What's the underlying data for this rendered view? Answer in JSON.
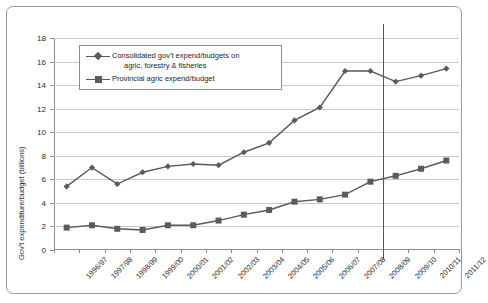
{
  "chart_data": {
    "type": "line",
    "title": "",
    "xlabel": "",
    "ylabel": "Gov't expenditure/budget (billions)",
    "ylim": [
      0,
      18
    ],
    "ytick_step": 2,
    "yticks": [
      "0",
      "2",
      "4",
      "6",
      "8",
      "10",
      "12",
      "14",
      "16",
      "18"
    ],
    "grid": true,
    "legend_position": "upper-left-inside",
    "categories": [
      "1996/97",
      "1997/98",
      "1998/99",
      "1999/00",
      "2000/01",
      "2001/02",
      "2002/03",
      "2003/04",
      "2004/05",
      "2005/06",
      "2006/07",
      "2007/08",
      "2008/09",
      "2009/10",
      "2010/11",
      "2011/12"
    ],
    "series": [
      {
        "name": "Consolidated gov't expend/budgets on agric, forestry & fisheries",
        "marker": "diamond",
        "values": [
          5.4,
          7.0,
          5.6,
          6.6,
          7.1,
          7.3,
          7.2,
          8.3,
          9.1,
          11.0,
          12.1,
          15.2,
          15.2,
          14.3,
          14.8,
          15.4
        ]
      },
      {
        "name": "Provincial agric expend/budget",
        "marker": "square",
        "values": [
          1.9,
          2.1,
          1.8,
          1.7,
          2.1,
          2.1,
          2.5,
          3.0,
          3.4,
          4.1,
          4.3,
          4.7,
          5.8,
          6.3,
          6.9,
          7.6
        ]
      }
    ],
    "annotations": [
      {
        "type": "vertical-line",
        "name": "budget-estimate-divider",
        "at_category_boundary_after": "2008/09"
      }
    ],
    "colors": {
      "series_line": "#59595b",
      "marker": "#5b5b5d",
      "gridline": "#c9c9c9",
      "axis": "#8d8d8d",
      "border": "#9a9a9a",
      "background": "#ffffff",
      "divider_line": "#555555",
      "text": "#1d1d1d"
    }
  },
  "legend": {
    "entries": [
      {
        "label_line1": "Consolidated gov't expend/budgets on",
        "label_line2": "agric, forestry & fisheries",
        "marker": "diamond-marker-icon"
      },
      {
        "label_line1": "Provincial agric expend/budget",
        "label_line2": "",
        "marker": "square-marker-icon"
      }
    ]
  }
}
